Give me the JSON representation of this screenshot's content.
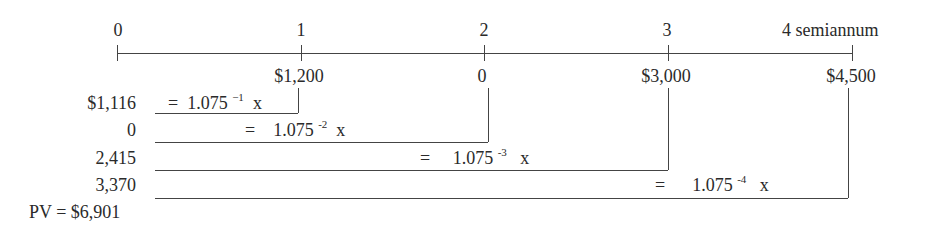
{
  "timeline": {
    "periods": [
      {
        "label": "0",
        "x": 117
      },
      {
        "label": "1",
        "x": 301
      },
      {
        "label": "2",
        "x": 484
      },
      {
        "label": "3",
        "x": 668
      },
      {
        "label": "4 semiannum",
        "x": 852
      }
    ],
    "cash_flows": [
      {
        "label": "$1,200",
        "x": 301
      },
      {
        "label": "0",
        "x": 484
      },
      {
        "label": "$3,000",
        "x": 668
      },
      {
        "label": "$4,500",
        "x": 852
      }
    ]
  },
  "discounting": [
    {
      "pv": "$1,116",
      "eq": "=",
      "base": "1.075",
      "exp": "−1",
      "mult": "x"
    },
    {
      "pv": "0",
      "eq": "=",
      "base": "1.075",
      "exp": "-2",
      "mult": "x"
    },
    {
      "pv": "2,415",
      "eq": "=",
      "base": "1.075",
      "exp": "-3",
      "mult": "x"
    },
    {
      "pv": "3,370",
      "eq": "=",
      "base": "1.075",
      "exp": "-4",
      "mult": "x"
    }
  ],
  "total": {
    "label": "PV = $6,901"
  }
}
